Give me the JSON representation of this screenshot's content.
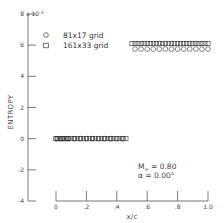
{
  "chart_data": {
    "type": "scatter",
    "title": "",
    "xlabel": "x/c",
    "ylabel": "ENTROPY",
    "y_multiplier_label": "x 10^-3",
    "xlim": [
      0,
      1.0
    ],
    "ylim": [
      -4,
      8
    ],
    "x_ticks": [
      0,
      0.2,
      0.4,
      0.6,
      0.8,
      1.0
    ],
    "x_tick_labels": [
      "0",
      ".2",
      ".4",
      ".6",
      ".8",
      "1.0"
    ],
    "y_ticks": [
      -4,
      -2,
      0,
      2,
      4,
      6,
      8
    ],
    "y_tick_labels": [
      "-4",
      "-2",
      "0",
      "2",
      "4",
      "6",
      "8"
    ],
    "grid": false,
    "legend_position": "upper-left",
    "data_note": "Point counts and x-positions are reconstructed, not read from the image. Markers were unresolvable at this resolution; only segment endpoints (x≈0-0.47 at y=0, x≈0.5-1.0 at y≈6) and levels were observed. Circles assumed evenly spaced at ~0.04, squares at ~0.02.",
    "series": [
      {
        "name": "81x17 grid",
        "marker": "circle",
        "segments": [
          {
            "x": [
              0.0,
              0.04,
              0.08,
              0.12,
              0.16,
              0.2,
              0.24,
              0.28,
              0.32,
              0.36,
              0.4,
              0.44
            ],
            "y": [
              0,
              0,
              0,
              0,
              0,
              0,
              0,
              0,
              0,
              0,
              0,
              0
            ]
          },
          {
            "x": [
              0.52,
              0.56,
              0.6,
              0.64,
              0.68,
              0.72,
              0.76,
              0.8,
              0.84,
              0.88,
              0.92,
              0.96,
              1.0
            ],
            "y": [
              5.75,
              5.75,
              5.75,
              5.75,
              5.75,
              5.75,
              5.75,
              5.75,
              5.75,
              5.75,
              5.75,
              5.75,
              5.75
            ]
          }
        ]
      },
      {
        "name": "161x33 grid",
        "marker": "square",
        "segments": [
          {
            "x": [
              0.0,
              0.01,
              0.02,
              0.03,
              0.04,
              0.05,
              0.06,
              0.07,
              0.08,
              0.1,
              0.12,
              0.14,
              0.16,
              0.18,
              0.2,
              0.22,
              0.24,
              0.26,
              0.28,
              0.3,
              0.32,
              0.34,
              0.36,
              0.38,
              0.4,
              0.42,
              0.44,
              0.46
            ],
            "y": [
              0,
              0,
              0,
              0,
              0,
              0,
              0,
              0,
              0,
              0,
              0,
              0,
              0,
              0,
              0,
              0,
              0,
              0,
              0,
              0,
              0,
              0,
              0,
              0,
              0,
              0,
              0,
              0
            ]
          },
          {
            "x": [
              0.5,
              0.52,
              0.54,
              0.56,
              0.58,
              0.6,
              0.62,
              0.64,
              0.66,
              0.68,
              0.7,
              0.72,
              0.74,
              0.76,
              0.78,
              0.8,
              0.82,
              0.84,
              0.86,
              0.88,
              0.9,
              0.92,
              0.94,
              0.96,
              0.98,
              1.0
            ],
            "y": [
              6.1,
              6.1,
              6.1,
              6.1,
              6.1,
              6.1,
              6.1,
              6.1,
              6.1,
              6.1,
              6.1,
              6.1,
              6.1,
              6.1,
              6.1,
              6.1,
              6.1,
              6.1,
              6.1,
              6.1,
              6.1,
              6.1,
              6.1,
              6.1,
              6.1,
              6.1
            ]
          }
        ]
      }
    ],
    "annotations": [
      {
        "text": "M∞ = 0.80",
        "base": "M",
        "subscript": "∞",
        "rest": "= 0.80"
      },
      {
        "text": "α = 0.00°"
      }
    ]
  },
  "legend": {
    "items": [
      {
        "label": "81x17 grid",
        "marker": "circle"
      },
      {
        "label": "161x33 grid",
        "marker": "square"
      }
    ]
  },
  "annotation": {
    "mach_base": "M",
    "mach_sub": "∞",
    "mach_rest": " =  0.80",
    "alpha": "α  =  0.00°"
  },
  "axes": {
    "xlabel": "x/c",
    "ylabel": "ENTROPY",
    "multiplier": "x 10",
    "multiplier_exp": "-3"
  },
  "colors": {
    "axis": "#555555",
    "marker_stroke": "#333333",
    "text": "#444444"
  }
}
